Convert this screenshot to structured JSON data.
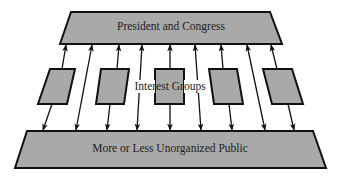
{
  "diagram": {
    "title": "",
    "nodes": {
      "top": {
        "label": "President and Congress"
      },
      "middle": {
        "label": "Interest Groups",
        "count": 5
      },
      "bottom": {
        "label": "More or Less Unorganized Public"
      }
    },
    "connections": [
      {
        "from": "public",
        "to": "interest-group-1",
        "then": "president-and-congress",
        "bidirectional": true
      },
      {
        "from": "public",
        "to": "president-and-congress",
        "direct": true,
        "bidirectional": true
      },
      {
        "from": "public",
        "to": "interest-group-2",
        "then": "president-and-congress",
        "bidirectional": true
      },
      {
        "from": "public",
        "to": "president-and-congress",
        "direct": true,
        "bidirectional": true
      },
      {
        "from": "public",
        "to": "interest-group-3",
        "then": "president-and-congress",
        "bidirectional": true
      },
      {
        "from": "public",
        "to": "president-and-congress",
        "direct": true,
        "bidirectional": true
      },
      {
        "from": "public",
        "to": "interest-group-4",
        "then": "president-and-congress",
        "bidirectional": true
      },
      {
        "from": "public",
        "to": "president-and-congress",
        "direct": true,
        "bidirectional": true
      },
      {
        "from": "public",
        "to": "interest-group-5",
        "then": "president-and-congress",
        "bidirectional": true
      }
    ],
    "colors": {
      "fill": "#a9a9a9",
      "stroke": "#111111",
      "text": "#222222",
      "background": "#ffffff"
    }
  }
}
